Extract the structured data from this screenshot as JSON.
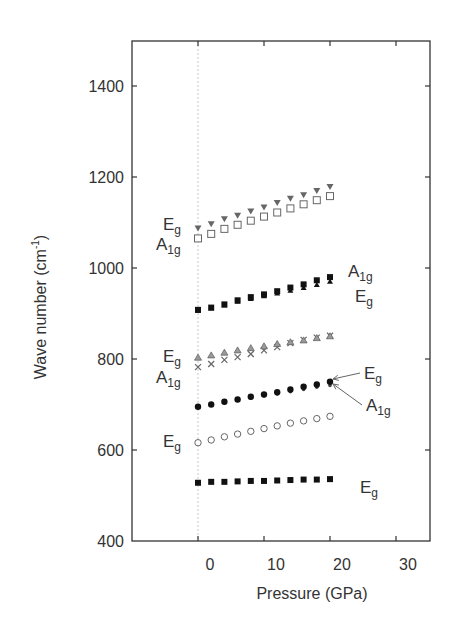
{
  "chart_data": {
    "type": "scatter",
    "title": "",
    "xlabel": "Pressure (GPa)",
    "ylabel": "Wave number (cm-1)",
    "ylabel_main": "Wave number (cm",
    "ylabel_sup": "-1",
    "ylabel_close": ")",
    "xlim": [
      -10,
      35
    ],
    "ylim": [
      400,
      1500
    ],
    "xticks": [
      0,
      10,
      20,
      30
    ],
    "xtick_labels": [
      "0",
      "10",
      "20",
      "30"
    ],
    "yticks": [
      400,
      600,
      800,
      1000,
      1200,
      1400
    ],
    "ytick_labels": [
      "400",
      "600",
      "800",
      "1000",
      "1200",
      "1400"
    ],
    "grid": false,
    "reference_line": {
      "x": 0,
      "style": "dotted",
      "color": "#c8c8c8"
    },
    "x": [
      0,
      2,
      4,
      6,
      8,
      10,
      12,
      14,
      16,
      18,
      20
    ],
    "series": [
      {
        "name": "Eg (high)",
        "mode": "Eg",
        "marker": "triangle-down-filled-gray",
        "values": [
          1087,
          1096,
          1107,
          1115,
          1124,
          1133,
          1143,
          1152,
          1160,
          1169,
          1178
        ]
      },
      {
        "name": "A1g (high)",
        "mode": "A1g",
        "marker": "square-open",
        "values": [
          1065,
          1075,
          1086,
          1095,
          1104,
          1113,
          1122,
          1131,
          1140,
          1149,
          1158
        ]
      },
      {
        "name": "A1g (~950)",
        "mode": "A1g",
        "marker": "square-filled",
        "values": [
          908,
          913,
          920,
          929,
          936,
          942,
          949,
          957,
          964,
          973,
          980
        ]
      },
      {
        "name": "Eg (~950)",
        "mode": "Eg",
        "marker": "triangle-up-filled",
        "values": [
          908,
          913,
          920,
          928,
          934,
          940,
          946,
          952,
          958,
          965,
          972
        ]
      },
      {
        "name": "Eg (~830)",
        "mode": "Eg",
        "marker": "triangle-up-open",
        "values": [
          804,
          809,
          815,
          820,
          825,
          829,
          834,
          838,
          842,
          847,
          851
        ]
      },
      {
        "name": "A1g (~830)",
        "mode": "A1g",
        "marker": "cross",
        "values": [
          782,
          789,
          798,
          804,
          811,
          819,
          826,
          835,
          842,
          847,
          851
        ]
      },
      {
        "name": "Eg (~720)",
        "mode": "Eg",
        "marker": "circle-filled",
        "values": [
          695,
          700,
          706,
          711,
          717,
          722,
          727,
          733,
          739,
          744,
          750
        ]
      },
      {
        "name": "A1g (~720)",
        "mode": "A1g",
        "marker": "circle-filled-small",
        "values": [
          695,
          699,
          704,
          709,
          714,
          719,
          723,
          728,
          733,
          738,
          742
        ]
      },
      {
        "name": "Eg (~640)",
        "mode": "Eg",
        "marker": "circle-open",
        "values": [
          616,
          622,
          629,
          635,
          641,
          647,
          653,
          659,
          664,
          669,
          674
        ]
      },
      {
        "name": "Eg (low)",
        "mode": "Eg",
        "marker": "square-filled",
        "values": [
          528,
          530,
          530,
          531,
          532,
          532,
          533,
          534,
          535,
          535,
          536
        ]
      }
    ],
    "annotations": [
      {
        "text": "E",
        "sub": "g",
        "x": 163,
        "y": 230,
        "side": "left"
      },
      {
        "text": "A",
        "sub": "1g",
        "x": 156,
        "y": 250,
        "side": "left"
      },
      {
        "text": "A",
        "sub": "1g",
        "x": 348,
        "y": 277,
        "side": "right"
      },
      {
        "text": "E",
        "sub": "g",
        "x": 355,
        "y": 302,
        "side": "right"
      },
      {
        "text": "E",
        "sub": "g",
        "x": 163,
        "y": 362,
        "side": "left"
      },
      {
        "text": "A",
        "sub": "1g",
        "x": 156,
        "y": 383,
        "side": "left"
      },
      {
        "text": "E",
        "sub": "g",
        "x": 364,
        "y": 379,
        "side": "right",
        "arrow_to": [
          333,
          379
        ]
      },
      {
        "text": "A",
        "sub": "1g",
        "x": 366,
        "y": 411,
        "side": "right",
        "arrow_to": [
          333,
          384
        ]
      },
      {
        "text": "E",
        "sub": "g",
        "x": 163,
        "y": 447,
        "side": "left"
      },
      {
        "text": "E",
        "sub": "g",
        "x": 360,
        "y": 493,
        "side": "right"
      }
    ],
    "legend": null
  },
  "colors": {
    "axis": "#333333",
    "text": "#333333",
    "marker_dark": "#111111",
    "marker_gray": "#666666",
    "reference_line": "#c8c8c8"
  }
}
